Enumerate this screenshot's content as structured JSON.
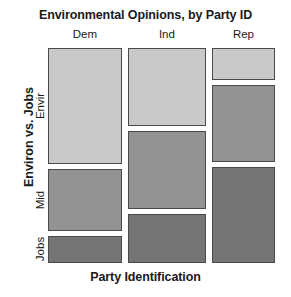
{
  "chart_data": {
    "type": "mosaic",
    "title": "Environmental Opinions, by Party ID",
    "xlabel": "Party Identification",
    "ylabel": "Environ vs. Jobs",
    "grid": false,
    "legend": "none",
    "x_categories": [
      "Dem",
      "Ind",
      "Rep"
    ],
    "y_categories": [
      "Envir",
      "Mid",
      "Jobs"
    ],
    "column_widths_pct": [
      32.6,
      34.4,
      27.8
    ],
    "cells": [
      {
        "column": "Dem",
        "width_pct": 32.6,
        "rows": [
          {
            "row": "Envir",
            "height_pct": 53.5,
            "color": "#c9c9c9"
          },
          {
            "row": "Mid",
            "height_pct": 28.8,
            "color": "#939393"
          },
          {
            "row": "Jobs",
            "height_pct": 12.6,
            "color": "#757575"
          }
        ]
      },
      {
        "column": "Ind",
        "width_pct": 34.4,
        "rows": [
          {
            "row": "Envir",
            "height_pct": 36.3,
            "color": "#c9c9c9"
          },
          {
            "row": "Mid",
            "height_pct": 36.3,
            "color": "#939393"
          },
          {
            "row": "Jobs",
            "height_pct": 22.8,
            "color": "#757575"
          }
        ]
      },
      {
        "column": "Rep",
        "width_pct": 27.8,
        "rows": [
          {
            "row": "Envir",
            "height_pct": 14.9,
            "color": "#c9c9c9"
          },
          {
            "row": "Mid",
            "height_pct": 35.8,
            "color": "#939393"
          },
          {
            "row": "Jobs",
            "height_pct": 44.7,
            "color": "#757575"
          }
        ]
      }
    ],
    "colors": {
      "envir": "#c9c9c9",
      "mid": "#939393",
      "jobs": "#757575",
      "tile_border": "#4a4a4a",
      "background": "#ffffff"
    }
  },
  "labels": {
    "title": "Environmental Opinions, by Party ID",
    "x_axis": "Party Identification",
    "y_axis": "Environ vs. Jobs",
    "columns": [
      "Dem",
      "Ind",
      "Rep"
    ],
    "rows": [
      "Envir",
      "Mid",
      "Jobs"
    ]
  }
}
